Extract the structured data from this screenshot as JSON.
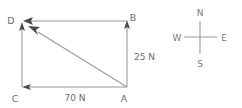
{
  "figure": {
    "type": "vector-diagram",
    "vertices": [
      {
        "id": "D",
        "label": "D",
        "x": 22,
        "y": 21,
        "label_x": 11,
        "label_y": 24
      },
      {
        "id": "B",
        "label": "B",
        "x": 127,
        "y": 21,
        "label_x": 132,
        "label_y": 21
      },
      {
        "id": "C",
        "label": "C",
        "x": 22,
        "y": 87,
        "label_x": 15,
        "label_y": 101
      },
      {
        "id": "A",
        "label": "A",
        "x": 127,
        "y": 87,
        "label_x": 122,
        "label_y": 101
      }
    ],
    "vectors": [
      {
        "name": "vector-a-to-b",
        "from": "A",
        "to": "B",
        "magnitude_label": "25 N",
        "label_x": 134,
        "label_y": 57
      },
      {
        "name": "vector-a-to-c",
        "from": "A",
        "to": "C",
        "magnitude_label": "70 N",
        "label_x": 62,
        "label_y": 101
      },
      {
        "name": "vector-a-to-d-resultant",
        "from": "A",
        "to": "D",
        "magnitude_label": "",
        "label_x": 0,
        "label_y": 0
      },
      {
        "name": "vector-b-to-d",
        "from": "B",
        "to": "D",
        "magnitude_label": "",
        "label_x": 0,
        "label_y": 0
      }
    ],
    "colors": {
      "line": "#9a9a9a",
      "arrow": "#4a4a4a",
      "label": "#6b6b6b",
      "background": "#ffffff"
    }
  },
  "compass": {
    "center_x": 200,
    "center_y": 37,
    "arm": 16,
    "north": {
      "label": "N",
      "x": 200,
      "y": 13
    },
    "south": {
      "label": "S",
      "x": 200,
      "y": 66
    },
    "west": {
      "label": "W",
      "x": 175,
      "y": 40
    },
    "east": {
      "label": "E",
      "x": 226,
      "y": 40
    }
  }
}
